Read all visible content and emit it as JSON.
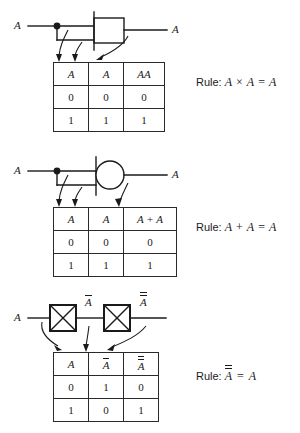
{
  "figure": {
    "background_color": "#ffffff",
    "ink_color": "#1a1a1a"
  },
  "blocks": [
    {
      "id": "and-rule",
      "gate": "and-gate",
      "gate_shape": "rectangle",
      "input_label": "A",
      "output_label": "A",
      "table": {
        "headers": [
          "A",
          "A",
          "AA"
        ],
        "rows": [
          [
            "0",
            "0",
            "0"
          ],
          [
            "1",
            "1",
            "1"
          ]
        ]
      },
      "rule": {
        "label": "Rule:",
        "expression": "A × A = A",
        "left": "A",
        "operator": "×",
        "right": "A",
        "equals": "=",
        "result": "A"
      }
    },
    {
      "id": "or-rule",
      "gate": "or-gate",
      "gate_shape": "circle",
      "input_label": "A",
      "output_label": "A",
      "table": {
        "headers": [
          "A",
          "A",
          "A + A"
        ],
        "rows": [
          [
            "0",
            "0",
            "0"
          ],
          [
            "1",
            "1",
            "1"
          ]
        ]
      },
      "rule": {
        "label": "Rule:",
        "expression": "A + A = A",
        "left": "A",
        "operator": "+",
        "right": "A",
        "equals": "=",
        "result": "A"
      }
    },
    {
      "id": "not-rule",
      "gate": "not-gate",
      "gate_shape": "boxed-x",
      "input_label": "A",
      "mid_label": "A",
      "mid_label_bars": 1,
      "output_label": "A",
      "output_label_bars": 2,
      "table": {
        "headers": [
          "A",
          "A",
          "A"
        ],
        "header_bars": [
          0,
          1,
          2
        ],
        "rows": [
          [
            "0",
            "1",
            "0"
          ],
          [
            "1",
            "0",
            "1"
          ]
        ]
      },
      "rule": {
        "label": "Rule:",
        "expression": "A̅̅ = A",
        "left": "A",
        "left_bars": 2,
        "equals": "=",
        "result": "A"
      }
    }
  ]
}
